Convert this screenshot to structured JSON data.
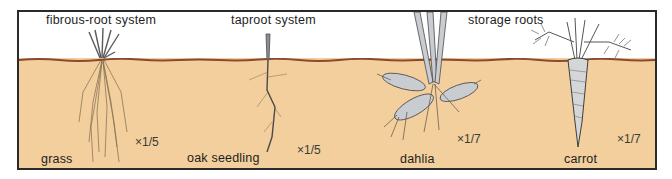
{
  "figure": {
    "background": "#ffffff",
    "soil_color": "#f2cf9c",
    "ground_line_color": "#8a4a2e",
    "border_color": "#2a2a2a"
  },
  "headings": {
    "fibrous": "fibrous-root system",
    "taproot": "taproot system",
    "storage": "storage roots"
  },
  "plants": [
    {
      "name": "grass",
      "scale": "×1/5",
      "system": "fibrous-root system"
    },
    {
      "name": "oak seedling",
      "scale": "×1/5",
      "system": "taproot system"
    },
    {
      "name": "dahlia",
      "scale": "×1/7",
      "system": "storage roots"
    },
    {
      "name": "carrot",
      "scale": "×1/7",
      "system": "storage roots"
    }
  ]
}
